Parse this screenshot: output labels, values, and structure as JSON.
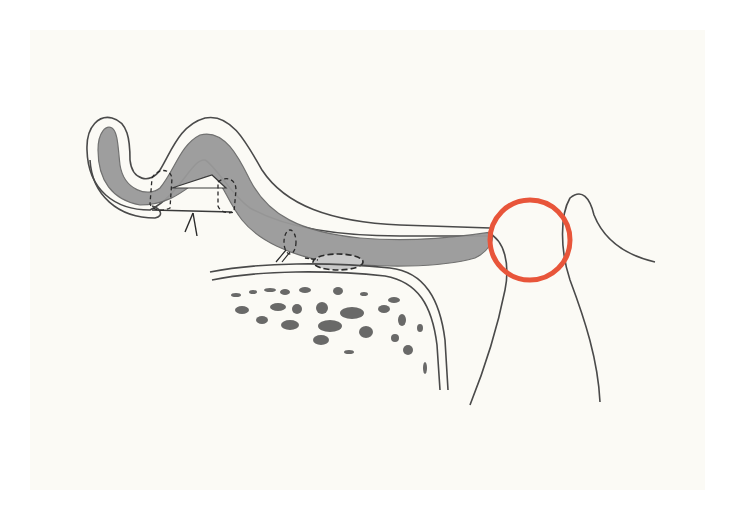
{
  "figure": {
    "type": "anatomical-line-illustration",
    "background_color": "#ffffff",
    "paper_color": "#fbfaf5",
    "paper_bounds": {
      "x": 30,
      "y": 30,
      "width": 675,
      "height": 460
    }
  },
  "colors": {
    "outline": "#4a4a4a",
    "tissue_fill": "#9a9a9a",
    "tissue_outline": "#6a6a6a",
    "highlight_circle": "#e8553a",
    "bone_spots": "#505050",
    "dash": "#2a2a2a"
  },
  "highlight": {
    "shape": "circle",
    "cx": 530,
    "cy": 240,
    "r": 40,
    "stroke_width": 5
  },
  "elements": {
    "soft_tissue_flap": "hooked band of grey tissue with outer white layer, running from upper-left hook to tip near red circle",
    "bone": "rounded bone block with double cortical outline and trabecular spots",
    "tooth_outline": "tall curved tooth/papilla contour on the right crossing the circle",
    "sutures": "dashed loops indicating suture points on the flap",
    "pointer_lines": "two small lines below the arch"
  }
}
